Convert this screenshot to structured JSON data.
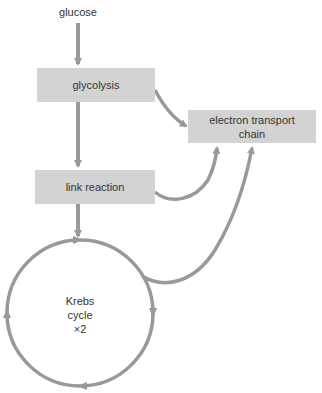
{
  "diagram": {
    "type": "flowchart",
    "title": "",
    "colors": {
      "stroke": "#999999",
      "box_fill": "#d3d3d3",
      "text": "#333333"
    },
    "nodes": {
      "glucose": {
        "label": "glucose"
      },
      "glycolysis": {
        "label": "glycolysis"
      },
      "etc": {
        "line1": "electron transport",
        "line2": "chain"
      },
      "link": {
        "label": "link reaction"
      },
      "krebs": {
        "line1": "Krebs",
        "line2": "cycle",
        "line3": "×2"
      }
    },
    "edges": [
      {
        "from": "glucose",
        "to": "glycolysis"
      },
      {
        "from": "glycolysis",
        "to": "link reaction"
      },
      {
        "from": "glycolysis",
        "to": "electron transport chain"
      },
      {
        "from": "link reaction",
        "to": "Krebs cycle"
      },
      {
        "from": "link reaction",
        "to": "electron transport chain"
      },
      {
        "from": "Krebs cycle",
        "to": "electron transport chain"
      }
    ]
  }
}
